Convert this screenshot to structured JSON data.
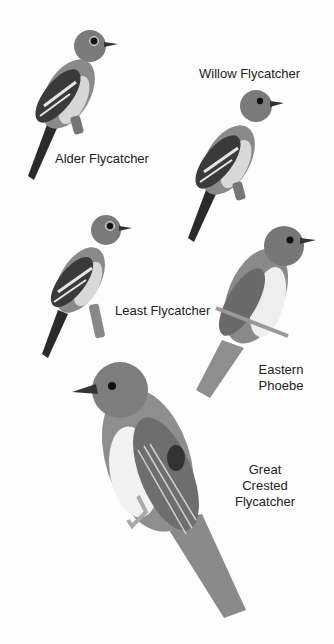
{
  "plate": {
    "background": "#ffffff",
    "text_color": "#222222"
  },
  "birds": [
    {
      "id": "alder",
      "label": "Alder Flycatcher"
    },
    {
      "id": "willow",
      "label": "Willow Flycatcher"
    },
    {
      "id": "least",
      "label": "Least Flycatcher"
    },
    {
      "id": "phoebe",
      "label_lines": [
        "Eastern",
        "Phoebe"
      ]
    },
    {
      "id": "great-crested",
      "label_lines": [
        "Great",
        "Crested",
        "Flycatcher"
      ]
    }
  ]
}
